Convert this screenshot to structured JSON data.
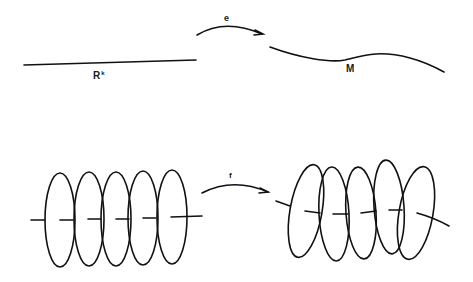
{
  "diagram": {
    "top": {
      "domain_label": "R",
      "domain_superscript": "k",
      "codomain_label": "M",
      "map_label": "e"
    },
    "bottom": {
      "map_label": "f",
      "left_disk_count": 5,
      "right_disk_count": 5
    }
  }
}
